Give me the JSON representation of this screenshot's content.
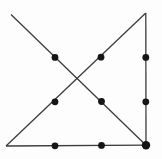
{
  "figure": {
    "canvas": {
      "width": 162,
      "height": 159
    },
    "background_color": "#fdfdfd",
    "line_color": "#3c3c3c",
    "dot_color": "#151515",
    "line_width": 1.3,
    "lines": [
      {
        "name": "diagonal-descending",
        "x1": 11,
        "y1": 14.5,
        "x2": 146,
        "y2": 145.2
      },
      {
        "name": "diagonal-ascending",
        "x1": 6,
        "y1": 146,
        "x2": 145.8,
        "y2": 13
      },
      {
        "name": "right-vertical",
        "x1": 145.8,
        "y1": 13,
        "x2": 146,
        "y2": 145.2
      },
      {
        "name": "bottom-horizontal",
        "x1": 6,
        "y1": 146,
        "x2": 146,
        "y2": 145.2
      }
    ],
    "dots": [
      {
        "name": "dot-top-left",
        "cx": 55,
        "cy": 57.4,
        "r": 3.4
      },
      {
        "name": "dot-top-middle",
        "cx": 101,
        "cy": 57.2,
        "r": 3.4
      },
      {
        "name": "dot-top-right",
        "cx": 145.8,
        "cy": 57.4,
        "r": 3.4
      },
      {
        "name": "dot-middle-left",
        "cx": 55,
        "cy": 101.8,
        "r": 3.4
      },
      {
        "name": "dot-center",
        "cx": 101.5,
        "cy": 101.5,
        "r": 3.4
      },
      {
        "name": "dot-middle-right",
        "cx": 145.8,
        "cy": 101.8,
        "r": 3.4
      },
      {
        "name": "dot-bottom-left",
        "cx": 55,
        "cy": 145.8,
        "r": 3.4
      },
      {
        "name": "dot-bottom-middle",
        "cx": 101.5,
        "cy": 145.4,
        "r": 3.4
      },
      {
        "name": "dot-bottom-right",
        "cx": 146,
        "cy": 145.2,
        "r": 4.2
      }
    ]
  }
}
